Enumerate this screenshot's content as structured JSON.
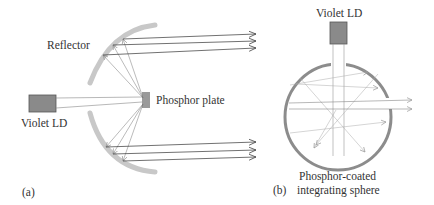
{
  "panel_a": {
    "label": "(a)",
    "reflector_label": "Reflector",
    "laser_label": "Violet LD",
    "phosphor_label": "Phosphor plate"
  },
  "panel_b": {
    "label": "(b)",
    "laser_label": "Violet LD",
    "sphere_label_line1": "Phosphor-coated",
    "sphere_label_line2": "integrating sphere"
  },
  "colors": {
    "laser_fill": "#8a8a8a",
    "reflector": "#c8c8c8",
    "sphere_ring": "#8c8c8c",
    "ray": "#555555",
    "ray_light": "#aaaaaa"
  }
}
